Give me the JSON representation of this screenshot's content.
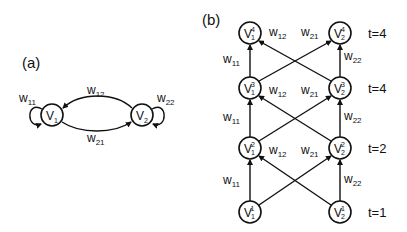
{
  "panel_a": {
    "label": "(a)",
    "nodes": [
      {
        "id": "V1",
        "name": "V",
        "sub": "1"
      },
      {
        "id": "V2",
        "name": "V",
        "sub": "2"
      }
    ],
    "edges": [
      {
        "from": "V1",
        "to": "V1",
        "label": "w",
        "sub": "11"
      },
      {
        "from": "V2",
        "to": "V1",
        "label": "w",
        "sub": "12"
      },
      {
        "from": "V2",
        "to": "V2",
        "label": "w",
        "sub": "22"
      },
      {
        "from": "V1",
        "to": "V2",
        "label": "w",
        "sub": "21"
      }
    ]
  },
  "panel_b": {
    "label": "(b)",
    "rows": [
      {
        "t_label": "t=4",
        "sup": "4"
      },
      {
        "t_label": "t=4",
        "sup": "3"
      },
      {
        "t_label": "t=2",
        "sup": "2"
      },
      {
        "t_label": "t=1",
        "sup": "1"
      }
    ],
    "node_name": "V",
    "subs": [
      "1",
      "2"
    ],
    "edge_labels": {
      "w11": {
        "label": "w",
        "sub": "11"
      },
      "w12": {
        "label": "w",
        "sub": "12"
      },
      "w21": {
        "label": "w",
        "sub": "21"
      },
      "w22": {
        "label": "w",
        "sub": "22"
      }
    }
  }
}
